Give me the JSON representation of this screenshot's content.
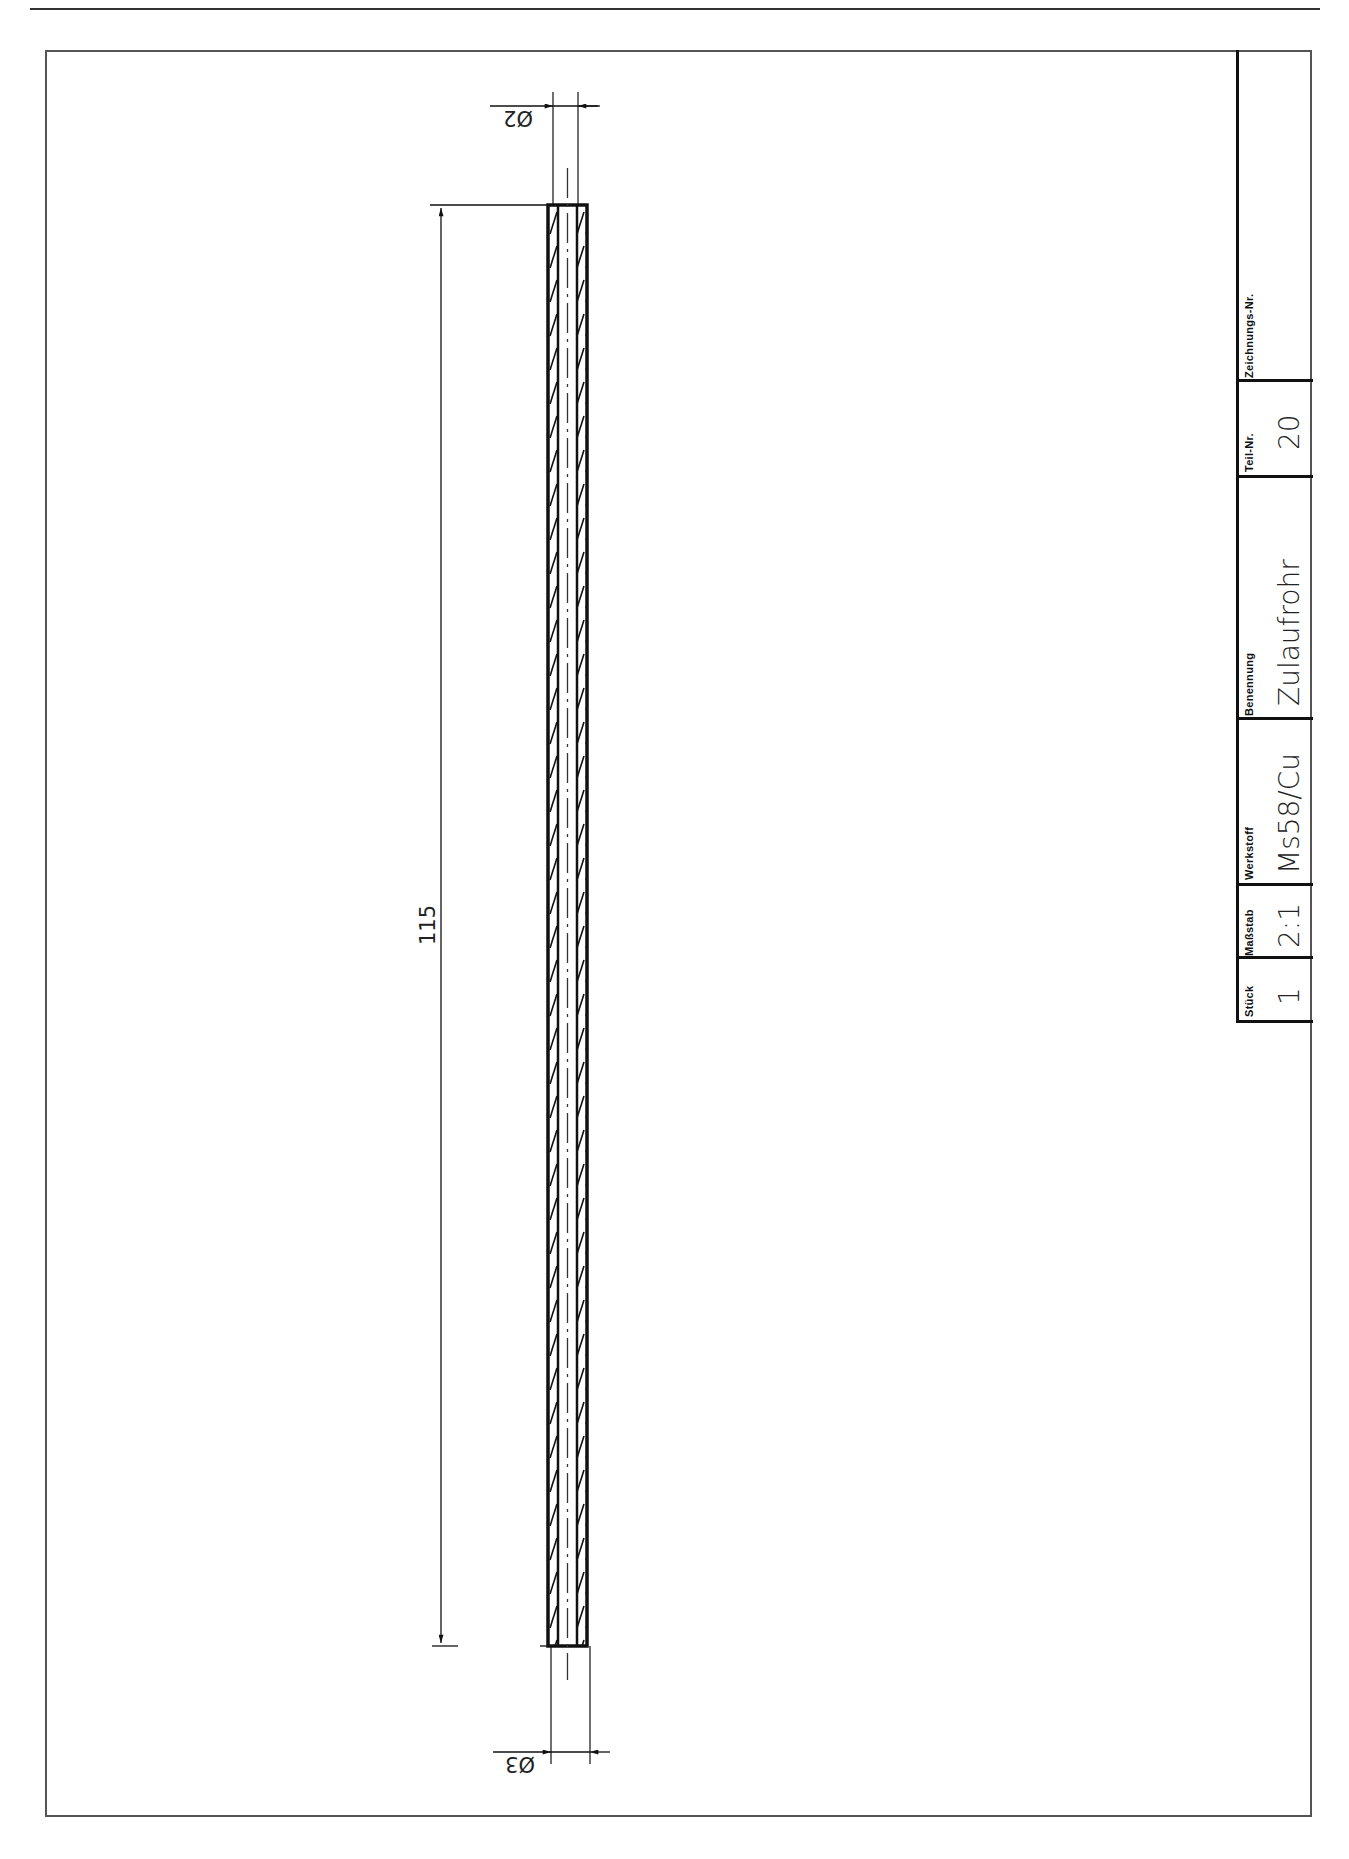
{
  "drawing": {
    "part": {
      "type": "tube",
      "view": "longitudinal section",
      "hatched_walls": true,
      "centerline": "dash-dot"
    },
    "dimensions": {
      "length": "115",
      "diameter_top": "Ø2",
      "diameter_bottom": "Ø3"
    }
  },
  "title_block": {
    "headers": {
      "drawing_number": "Zeichnungs-Nr.",
      "part_number": "Teil-Nr.",
      "name": "Benennung",
      "material": "Werkstoff",
      "scale": "Maßstab",
      "quantity": "Stück"
    },
    "values": {
      "drawing_number": "",
      "part_number": "20",
      "name": "Zulaufrohr",
      "material": "Ms58/Cu",
      "scale": "2:1",
      "quantity": "1"
    }
  },
  "colors": {
    "line": "#111111",
    "frame": "#555555",
    "paper": "#ffffff"
  }
}
